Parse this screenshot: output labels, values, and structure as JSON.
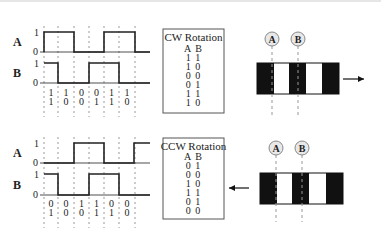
{
  "diagrams": [
    {
      "id": "cw",
      "origin_y": 0,
      "channel_labels": [
        "A",
        "B"
      ],
      "level_labels": {
        "high": "1",
        "low": "0"
      },
      "dashed_x": [
        44,
        58,
        74,
        89,
        104,
        119,
        135
      ],
      "waveforms": {
        "A": {
          "y_high": 32,
          "y_low": 52,
          "points": [
            [
              44,
              52
            ],
            [
              44,
              32
            ],
            [
              74,
              32
            ],
            [
              74,
              52
            ],
            [
              104,
              52
            ],
            [
              104,
              32
            ],
            [
              135,
              32
            ],
            [
              135,
              52
            ],
            [
              150,
              52
            ]
          ]
        },
        "B": {
          "y_high": 63,
          "y_low": 83,
          "points": [
            [
              44,
              63
            ],
            [
              58,
              63
            ],
            [
              58,
              83
            ],
            [
              89,
              83
            ],
            [
              89,
              63
            ],
            [
              119,
              63
            ],
            [
              119,
              83
            ],
            [
              150,
              83
            ]
          ]
        }
      },
      "bit_columns": [
        {
          "a": "1",
          "b": "1"
        },
        {
          "a": "1",
          "b": "0"
        },
        {
          "a": "0",
          "b": "0"
        },
        {
          "a": "0",
          "b": "1"
        },
        {
          "a": "1",
          "b": "1"
        },
        {
          "a": "1",
          "b": "0"
        }
      ],
      "bit_y": [
        93,
        102
      ],
      "dash_bottom": 117,
      "table": {
        "title": "CW Rotation",
        "header": "A B",
        "rows": [
          "1 1",
          "1 0",
          "0 0",
          "0 1",
          "1 1",
          "1 0"
        ],
        "box": {
          "x": 163,
          "y": 29,
          "w": 61,
          "h": 84
        }
      },
      "encoder": {
        "sensors": [
          {
            "label": "A",
            "cx": 272,
            "cy": 39
          },
          {
            "label": "B",
            "cx": 298,
            "cy": 39
          }
        ],
        "strip": {
          "x": 257,
          "y": 63,
          "h": 31,
          "segments": [
            {
              "w": 17,
              "color": "#111111"
            },
            {
              "w": 15,
              "color": "#ffffff"
            },
            {
              "w": 17,
              "color": "#111111"
            },
            {
              "w": 16,
              "color": "#ffffff"
            },
            {
              "w": 17,
              "color": "#111111"
            }
          ]
        },
        "sensor_line_bottom": 115,
        "arrow": {
          "direction": "right",
          "x1": 343,
          "x2": 364,
          "y": 79
        }
      }
    },
    {
      "id": "ccw",
      "origin_y": 0,
      "channel_labels": [
        "A",
        "B"
      ],
      "level_labels": {
        "high": "1",
        "low": "0"
      },
      "dashed_x": [
        44,
        58,
        74,
        89,
        104,
        119,
        135
      ],
      "waveforms": {
        "A": {
          "y_high": 143,
          "y_low": 163,
          "points": [
            [
              44,
              163
            ],
            [
              74,
              163
            ],
            [
              74,
              143
            ],
            [
              104,
              143
            ],
            [
              104,
              163
            ],
            [
              134,
              163
            ],
            [
              134,
              143
            ],
            [
              150,
              143
            ]
          ]
        },
        "B": {
          "y_high": 174,
          "y_low": 195,
          "points": [
            [
              44,
              174
            ],
            [
              58,
              174
            ],
            [
              58,
              195
            ],
            [
              89,
              195
            ],
            [
              89,
              174
            ],
            [
              119,
              174
            ],
            [
              119,
              195
            ],
            [
              150,
              195
            ]
          ]
        }
      },
      "bit_columns": [
        {
          "a": "0",
          "b": "1"
        },
        {
          "a": "0",
          "b": "0"
        },
        {
          "a": "1",
          "b": "0"
        },
        {
          "a": "1",
          "b": "1"
        },
        {
          "a": "0",
          "b": "1"
        },
        {
          "a": "0",
          "b": "0"
        }
      ],
      "bit_y": [
        204,
        213
      ],
      "dash_bottom": 228,
      "table": {
        "title": "CCW Rotation",
        "header": "A B",
        "rows": [
          "0 1",
          "0 0",
          "1 0",
          "1 1",
          "0 1",
          "0 0"
        ],
        "box": {
          "x": 163,
          "y": 138,
          "w": 61,
          "h": 81
        }
      },
      "encoder": {
        "sensors": [
          {
            "label": "A",
            "cx": 276,
            "cy": 148
          },
          {
            "label": "B",
            "cx": 302,
            "cy": 148
          }
        ],
        "strip": {
          "x": 260,
          "y": 173,
          "h": 31,
          "segments": [
            {
              "w": 17,
              "color": "#111111"
            },
            {
              "w": 15,
              "color": "#ffffff"
            },
            {
              "w": 17,
              "color": "#111111"
            },
            {
              "w": 17,
              "color": "#ffffff"
            },
            {
              "w": 17,
              "color": "#111111"
            }
          ]
        },
        "sensor_line_bottom": 222,
        "arrow": {
          "direction": "left",
          "x1": 249,
          "x2": 229,
          "y": 188
        }
      }
    }
  ],
  "colors": {
    "line": "#222222",
    "dash": "#999999",
    "circle_fill": "#e8e8e8",
    "circle_stroke": "#888888",
    "box_stroke": "#555555"
  }
}
